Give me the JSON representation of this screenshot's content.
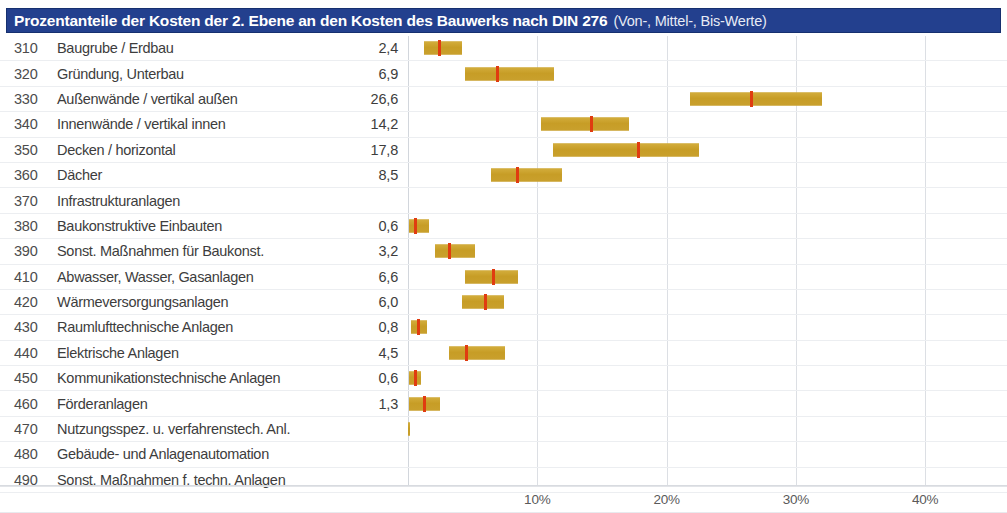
{
  "header": {
    "title_main": "Prozentanteile der Kosten der 2. Ebene an den Kosten des Bauwerks nach DIN 276",
    "title_sub": "(Von-, Mittel-, Bis-Werte)",
    "bg_color": "#23408e",
    "text_color": "#ffffff"
  },
  "colors": {
    "bar": "#c8a02c",
    "mid_marker": "#e03c10",
    "gridline": "#dcdfe4",
    "row_rule": "#eceef1",
    "text": "#3d3d3d"
  },
  "chart_data": {
    "type": "bar",
    "subtype": "range-bar-with-median",
    "title": "Prozentanteile der Kosten der 2. Ebene an den Kosten des Bauwerks nach DIN 276 (Von-, Mittel-, Bis-Werte)",
    "xlabel": "",
    "ylabel": "",
    "xlim": [
      0,
      41.5
    ],
    "xticks": [
      10,
      20,
      30,
      40
    ],
    "xtick_labels": [
      "10%",
      "20%",
      "30%",
      "40%"
    ],
    "grid": true,
    "legend": null,
    "categories": [
      "310 Baugrube / Erdbau",
      "320 Gründung, Unterbau",
      "330 Außenwände / vertikal außen",
      "340 Innenwände / vertikal innen",
      "350 Decken / horizontal",
      "360 Dächer",
      "370 Infrastrukturanlagen",
      "380 Baukonstruktive Einbauten",
      "390 Sonst. Maßnahmen für Baukonst.",
      "410 Abwasser, Wasser, Gasanlagen",
      "420 Wärmeversorgungsanlagen",
      "430 Raumlufttechnische Anlagen",
      "440 Elektrische Anlagen",
      "450 Kommunikationstechnische Anlagen",
      "460 Förderanlagen",
      "470 Nutzungsspez. u. verfahrenstech. Anl.",
      "480 Gebäude- und Anlagenautomation",
      "490 Sonst. Maßnahmen f. techn. Anlagen"
    ],
    "values": [
      2.4,
      6.9,
      26.6,
      14.2,
      17.8,
      8.5,
      null,
      0.6,
      3.2,
      6.6,
      6.0,
      0.8,
      4.5,
      0.6,
      1.3,
      null,
      null,
      null
    ],
    "ranges": [
      [
        1.2,
        4.2
      ],
      [
        4.4,
        11.3
      ],
      [
        21.8,
        32.0
      ],
      [
        10.3,
        17.1
      ],
      [
        11.2,
        22.5
      ],
      [
        6.4,
        11.9
      ],
      null,
      [
        0.1,
        1.6
      ],
      [
        2.1,
        5.2
      ],
      [
        4.4,
        8.5
      ],
      [
        4.2,
        7.4
      ],
      [
        0.2,
        1.5
      ],
      [
        3.2,
        7.5
      ],
      [
        0.1,
        1.0
      ],
      [
        0.1,
        2.5
      ],
      null,
      null,
      null
    ]
  },
  "rows": [
    {
      "code": "310",
      "label": "Baugrube / Erdbau",
      "value": "2,4",
      "from": 1.2,
      "to": 4.2,
      "mid": 2.4
    },
    {
      "code": "320",
      "label": "Gründung, Unterbau",
      "value": "6,9",
      "from": 4.4,
      "to": 11.3,
      "mid": 6.9
    },
    {
      "code": "330",
      "label": "Außenwände / vertikal außen",
      "value": "26,6",
      "from": 21.8,
      "to": 32.0,
      "mid": 26.6
    },
    {
      "code": "340",
      "label": "Innenwände / vertikal innen",
      "value": "14,2",
      "from": 10.3,
      "to": 17.1,
      "mid": 14.2
    },
    {
      "code": "350",
      "label": "Decken / horizontal",
      "value": "17,8",
      "from": 11.2,
      "to": 22.5,
      "mid": 17.8
    },
    {
      "code": "360",
      "label": "Dächer",
      "value": "8,5",
      "from": 6.4,
      "to": 11.9,
      "mid": 8.5
    },
    {
      "code": "370",
      "label": "Infrastrukturanlagen",
      "value": "",
      "from": null,
      "to": null,
      "mid": null
    },
    {
      "code": "380",
      "label": "Baukonstruktive Einbauten",
      "value": "0,6",
      "from": 0.1,
      "to": 1.6,
      "mid": 0.6
    },
    {
      "code": "390",
      "label": "Sonst. Maßnahmen für Baukonst.",
      "value": "3,2",
      "from": 2.1,
      "to": 5.2,
      "mid": 3.2
    },
    {
      "code": "410",
      "label": "Abwasser, Wasser, Gasanlagen",
      "value": "6,6",
      "from": 4.4,
      "to": 8.5,
      "mid": 6.6
    },
    {
      "code": "420",
      "label": "Wärmeversorgungsanlagen",
      "value": "6,0",
      "from": 4.2,
      "to": 7.4,
      "mid": 6.0
    },
    {
      "code": "430",
      "label": "Raumlufttechnische Anlagen",
      "value": "0,8",
      "from": 0.2,
      "to": 1.5,
      "mid": 0.8
    },
    {
      "code": "440",
      "label": "Elektrische Anlagen",
      "value": "4,5",
      "from": 3.2,
      "to": 7.5,
      "mid": 4.5
    },
    {
      "code": "450",
      "label": "Kommunikationstechnische Anlagen",
      "value": "0,6",
      "from": 0.1,
      "to": 1.0,
      "mid": 0.6
    },
    {
      "code": "460",
      "label": "Förderanlagen",
      "value": "1,3",
      "from": 0.1,
      "to": 2.5,
      "mid": 1.3
    },
    {
      "code": "470",
      "label": "Nutzungsspez. u. verfahrenstech. Anl.",
      "value": "",
      "from": 0.0,
      "to": 0.1,
      "mid": null
    },
    {
      "code": "480",
      "label": "Gebäude- und Anlagenautomation",
      "value": "",
      "from": null,
      "to": null,
      "mid": null
    },
    {
      "code": "490",
      "label": "Sonst. Maßnahmen f. techn. Anlagen",
      "value": "",
      "from": null,
      "to": null,
      "mid": null
    }
  ],
  "axis": {
    "x0_px": 408,
    "px_per_percent": 12.93,
    "ticks": [
      {
        "label": "10%",
        "v": 10
      },
      {
        "label": "20%",
        "v": 20
      },
      {
        "label": "30%",
        "v": 30
      },
      {
        "label": "40%",
        "v": 40
      }
    ]
  }
}
